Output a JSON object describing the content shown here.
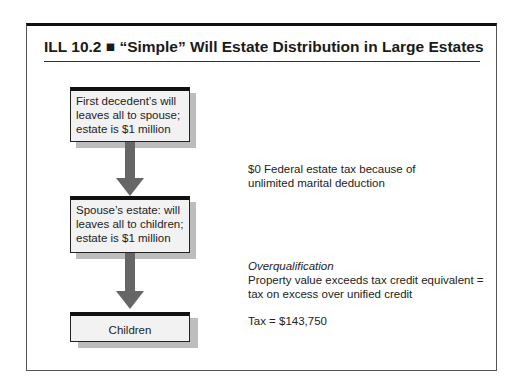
{
  "figure": {
    "title": "ILL 10.2 ■ “Simple” Will Estate Distribution in Large Estates"
  },
  "flow": {
    "boxes": [
      {
        "lines": [
          "First decedent’s will",
          "leaves all to spouse;",
          "estate is $1 million"
        ]
      },
      {
        "lines": [
          "Spouse’s estate: will",
          "leaves all to children;",
          "estate is $1 million"
        ]
      },
      {
        "lines": [
          "Children"
        ]
      }
    ]
  },
  "notes": {
    "first": [
      "$0 Federal estate tax because of",
      "unlimited marital deduction"
    ],
    "second_heading": "Overqualification",
    "second": [
      "Property value exceeds tax credit equivalent =",
      "tax on excess over unified credit"
    ],
    "tax": "Tax = $143,750"
  },
  "colors": {
    "arrow": "#666666",
    "box_fill": "#f2f2f2",
    "box_header": "#111111",
    "shadow": "#bdbdbd"
  }
}
